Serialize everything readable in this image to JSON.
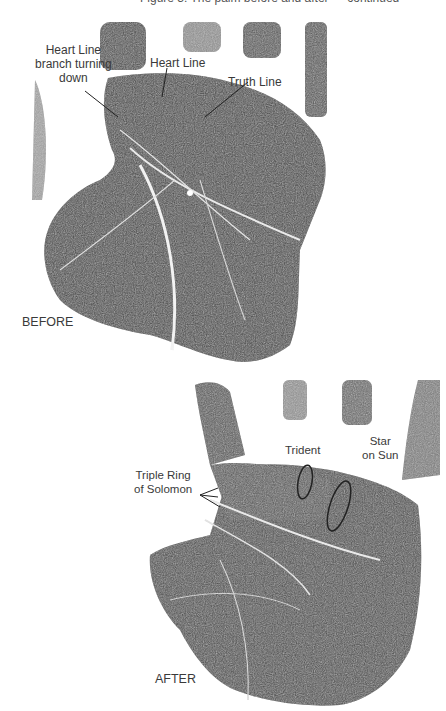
{
  "top_caption": "Figure 3: The palm before and after — continued",
  "before": {
    "tag": "BEFORE",
    "annotations": [
      {
        "id": "heart-line-branch",
        "lines": [
          "Heart Line",
          "branch turning",
          "down"
        ]
      },
      {
        "id": "heart-line",
        "lines": [
          "Heart Line"
        ]
      },
      {
        "id": "truth-line",
        "lines": [
          "Truth Line"
        ]
      }
    ]
  },
  "after": {
    "tag": "AFTER",
    "annotations": [
      {
        "id": "triple-ring",
        "lines": [
          "Triple Ring",
          "of Solomon"
        ]
      },
      {
        "id": "trident",
        "lines": [
          "Trident"
        ]
      },
      {
        "id": "star-on-sun",
        "lines": [
          "Star",
          "on Sun"
        ]
      }
    ]
  },
  "colors": {
    "palm_dark": "#3c3c3c",
    "palm_mid": "#5a5a5a",
    "crease": "#e8e8e8",
    "leader": "#222222",
    "background": "#ffffff"
  }
}
